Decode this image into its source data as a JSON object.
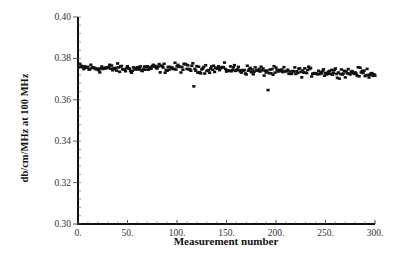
{
  "chart_data": {
    "type": "scatter",
    "title": "",
    "xlabel": "Measurement number",
    "ylabel": "db/cm/MHz at 100 MHz",
    "xlim": [
      0,
      300
    ],
    "ylim": [
      0.3,
      0.4
    ],
    "x_ticks": [
      "0.",
      "50.",
      "100.",
      "150.",
      "200.",
      "250.",
      "300."
    ],
    "y_ticks": [
      "0.30",
      "0.32",
      "0.34",
      "0.36",
      "0.38",
      "0.40"
    ],
    "grid": false,
    "legend": null,
    "marker": "square",
    "marker_color": "#111111",
    "series": [
      {
        "name": "attenuation",
        "summary": {
          "n_points": 300,
          "mean": 0.3745,
          "min": 0.3647,
          "max": 0.3785
        },
        "outliers": [
          {
            "x": 117,
            "y": 0.3665
          },
          {
            "x": 192,
            "y": 0.3647
          }
        ],
        "trend": [
          {
            "x": 0,
            "y": 0.3755
          },
          {
            "x": 50,
            "y": 0.375
          },
          {
            "x": 100,
            "y": 0.3755
          },
          {
            "x": 150,
            "y": 0.375
          },
          {
            "x": 200,
            "y": 0.3735
          },
          {
            "x": 250,
            "y": 0.3735
          },
          {
            "x": 300,
            "y": 0.373
          }
        ],
        "spread": 0.003
      }
    ]
  },
  "axes": {
    "xlabel": "Measurement number",
    "ylabel": "db/cm/MHz at 100 MHz"
  }
}
